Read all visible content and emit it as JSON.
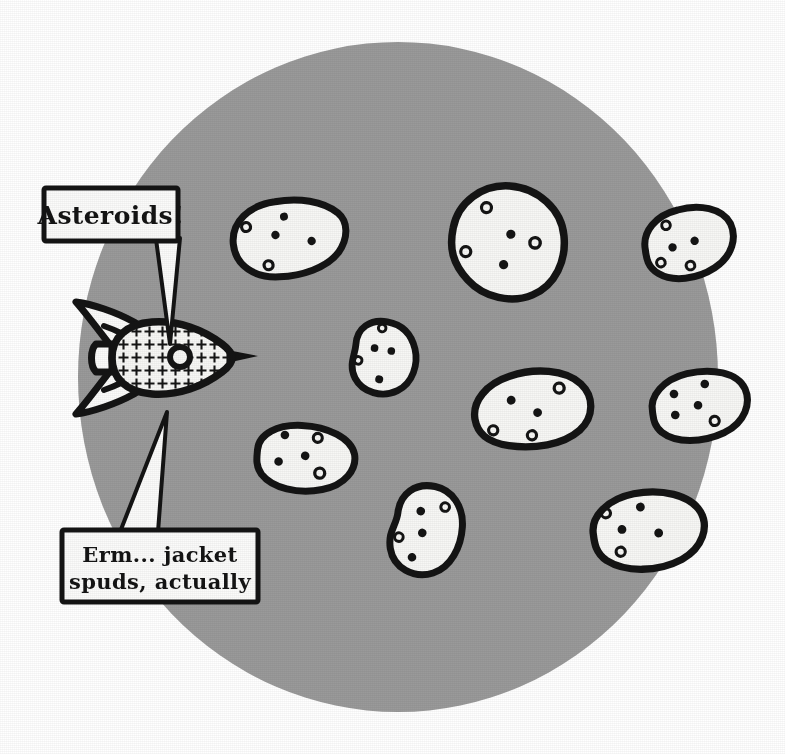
{
  "scene": {
    "title": "Asteroids cartoon",
    "canvas": {
      "width": 785,
      "height": 754
    },
    "colors": {
      "background": "#ffffff",
      "space_circle": "#9a9a9a",
      "ink": "#111111",
      "potato_fill": "#f7f7f5",
      "bubble_fill": "#fbfbfa"
    },
    "space_circle": {
      "cx": 398,
      "cy": 377,
      "rx": 320,
      "ry": 335
    }
  },
  "speech_bubbles": [
    {
      "name": "asteroids-bubble",
      "lines": [
        "Asteroids!"
      ],
      "box": {
        "x": 44,
        "y": 188,
        "w": 134,
        "h": 52
      },
      "tail_points": "150,240 178,240 168,340 152,241"
    },
    {
      "name": "spuds-bubble",
      "lines": [
        "Erm... jacket",
        "spuds, actually"
      ],
      "box": {
        "x": 62,
        "y": 530,
        "w": 196,
        "h": 72
      },
      "tail_points": "112,530 160,530 166,415"
    }
  ],
  "rocket": {
    "name": "rocket-ship",
    "body": {
      "cx": 165,
      "cy": 358,
      "rx": 62,
      "ry": 36
    },
    "porthole": {
      "cx": 178,
      "cy": 356,
      "r": 9
    },
    "pattern": "plus-hatch",
    "nose_direction": "right",
    "fins": 3,
    "exhaust": "left"
  },
  "potatoes": [
    {
      "id": "potato-top-left",
      "label": "asteroid",
      "cx": 290,
      "cy": 238,
      "rx": 57,
      "ry": 38,
      "rot": -8,
      "eyes": 4
    },
    {
      "id": "potato-top-center",
      "label": "asteroid",
      "cx": 508,
      "cy": 242,
      "rx": 58,
      "ry": 56,
      "rot": 6,
      "eyes": 5
    },
    {
      "id": "potato-top-right",
      "label": "asteroid",
      "cx": 690,
      "cy": 243,
      "rx": 45,
      "ry": 35,
      "rot": -14,
      "eyes": 4
    },
    {
      "id": "potato-center",
      "label": "asteroid",
      "cx": 385,
      "cy": 358,
      "rx": 32,
      "ry": 35,
      "rot": 10,
      "eyes": 4
    },
    {
      "id": "potato-mid-right",
      "label": "asteroid",
      "cx": 533,
      "cy": 407,
      "rx": 59,
      "ry": 39,
      "rot": -6,
      "eyes": 5
    },
    {
      "id": "potato-right",
      "label": "asteroid",
      "cx": 700,
      "cy": 405,
      "rx": 48,
      "ry": 33,
      "rot": -9,
      "eyes": 5
    },
    {
      "id": "potato-bottom-left",
      "label": "asteroid",
      "cx": 307,
      "cy": 458,
      "rx": 50,
      "ry": 33,
      "rot": 5,
      "eyes": 5
    },
    {
      "id": "potato-bottom-mid",
      "label": "asteroid",
      "cx": 428,
      "cy": 530,
      "rx": 34,
      "ry": 43,
      "rot": 12,
      "eyes": 4
    },
    {
      "id": "potato-bottom-right",
      "label": "asteroid",
      "cx": 650,
      "cy": 528,
      "rx": 56,
      "ry": 38,
      "rot": -7,
      "eyes": 5
    }
  ]
}
